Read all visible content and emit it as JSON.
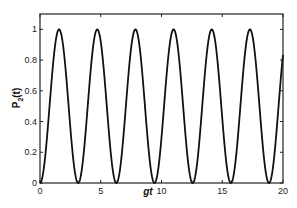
{
  "chart_data": {
    "type": "line",
    "title": "",
    "xlabel": "gt",
    "ylabel": "P_2(t)",
    "ylabel_main": "P",
    "ylabel_sub": "2",
    "ylabel_tail": "(t)",
    "xlim": [
      0,
      20
    ],
    "ylim": [
      0,
      1.1
    ],
    "xticks": [
      0,
      5,
      10,
      15,
      20
    ],
    "yticks": [
      0,
      0.2,
      0.4,
      0.6,
      0.8,
      1
    ],
    "xtick_labels": [
      "0",
      "5",
      "10",
      "15",
      "20"
    ],
    "ytick_labels": [
      "0",
      "0.2",
      "0.4",
      "0.6",
      "0.8",
      "1"
    ],
    "grid": false,
    "legend": null,
    "series": [
      {
        "name": "P2(t) = sin^2(gt)",
        "function": "sin^2(x)",
        "color": "#111111",
        "x": [
          0,
          0.785,
          1.571,
          2.356,
          3.142,
          3.927,
          4.712,
          5.498,
          6.283,
          7.069,
          7.854,
          8.639,
          9.425,
          10.21,
          10.996,
          11.781,
          12.566,
          13.352,
          14.137,
          14.923,
          15.708,
          16.493,
          17.279,
          18.064,
          18.85,
          19.635,
          20
        ],
        "values": [
          0,
          0.5,
          1,
          0.5,
          0,
          0.5,
          1,
          0.5,
          0,
          0.5,
          1,
          0.5,
          0,
          0.5,
          1,
          0.5,
          0,
          0.5,
          1,
          0.5,
          0,
          0.5,
          1,
          0.5,
          0,
          0.5,
          0.83
        ]
      }
    ]
  }
}
